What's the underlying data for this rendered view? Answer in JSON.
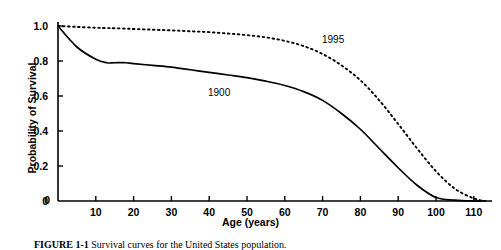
{
  "figure": {
    "caption_label": "FIGURE 1-1",
    "caption_text": "Survival curves for the United States population.",
    "background": "#ffffff",
    "ink_color": "#000000"
  },
  "axes": {
    "x": {
      "label": "Age (years)",
      "ticks": [
        0,
        10,
        20,
        30,
        40,
        50,
        60,
        70,
        80,
        90,
        100,
        110
      ],
      "tick_labels": [
        "0",
        "10",
        "20",
        "30",
        "40",
        "50",
        "60",
        "70",
        "80",
        "90",
        "100",
        "110"
      ],
      "range": [
        0,
        115
      ]
    },
    "y": {
      "label": "Probability of Survival",
      "ticks": [
        0,
        0.2,
        0.4,
        0.6,
        0.8,
        1.0
      ],
      "tick_labels": [
        "0",
        "0.2",
        "0.4",
        "0.6",
        "0.8",
        "1.0"
      ],
      "range": [
        0,
        1.0
      ]
    }
  },
  "annotations": [
    {
      "name": "series-label-1900",
      "text": "1900",
      "x_px": 208,
      "y_px": 88
    },
    {
      "name": "series-label-1995",
      "text": "1995",
      "x_px": 322,
      "y_px": 35
    }
  ],
  "chart_data": {
    "type": "line",
    "title": "",
    "xlabel": "Age (years)",
    "ylabel": "Probability of Survival",
    "xlim": [
      0,
      115
    ],
    "ylim": [
      0,
      1.0
    ],
    "grid": false,
    "legend": "inline-annotations",
    "x": [
      0,
      5,
      10,
      13,
      15,
      18,
      20,
      25,
      30,
      35,
      40,
      45,
      50,
      55,
      60,
      65,
      70,
      75,
      80,
      85,
      90,
      95,
      100,
      105,
      110,
      113
    ],
    "series": [
      {
        "name": "1900",
        "style": "solid",
        "values": [
          1.0,
          0.88,
          0.81,
          0.79,
          0.79,
          0.79,
          0.785,
          0.775,
          0.765,
          0.75,
          0.735,
          0.72,
          0.705,
          0.685,
          0.66,
          0.625,
          0.575,
          0.5,
          0.41,
          0.3,
          0.19,
          0.09,
          0.02,
          0.005,
          0.0,
          0.0
        ]
      },
      {
        "name": "1995",
        "style": "dotted",
        "values": [
          1.0,
          0.995,
          0.99,
          0.988,
          0.987,
          0.985,
          0.983,
          0.979,
          0.975,
          0.97,
          0.965,
          0.957,
          0.948,
          0.935,
          0.915,
          0.885,
          0.84,
          0.775,
          0.69,
          0.575,
          0.44,
          0.3,
          0.17,
          0.07,
          0.015,
          0.0
        ]
      }
    ]
  }
}
